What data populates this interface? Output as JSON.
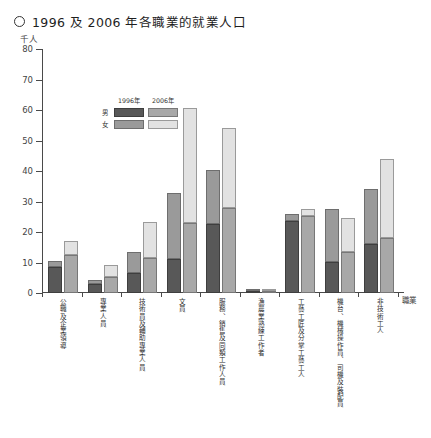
{
  "header": {
    "bullet_icon": "circle-outline-icon",
    "title": "1996 及 2006 年各職業的就業人口"
  },
  "legend": {
    "col_headers": [
      "1996年",
      "2006年"
    ],
    "row_labels": [
      "男",
      "女"
    ],
    "position": "top-left-inside-plot"
  },
  "axes": {
    "y_unit": "千人",
    "x_name": "職業",
    "y_ticks": [
      "0",
      "10",
      "20",
      "30",
      "40",
      "50",
      "60",
      "70",
      "80"
    ]
  },
  "chart_data": {
    "type": "bar",
    "subtype": "grouped-stacked",
    "title": "1996 及 2006 年各職業的就業人口",
    "xlabel": "職業",
    "ylabel": "千人",
    "ylim": [
      0,
      80
    ],
    "ytick_step": 10,
    "grid": false,
    "legend_position": "inside top-left",
    "categories": [
      "公職及企業領導",
      "專業人員",
      "技術員及輔助專業人員",
      "文員",
      "服務、銷售及同類工作人員",
      "漁農業熟練工作者",
      "工藝工匠及分掌工藝工人",
      "機台、機械操作員、司機及裝配員",
      "非技術工人"
    ],
    "series": [
      {
        "name": "1996年 男",
        "year": "1996",
        "sex": "男",
        "color": "#585858",
        "values": [
          8.5,
          3.0,
          6.7,
          11.2,
          22.7,
          0.7,
          23.5,
          10.2,
          16.0
        ]
      },
      {
        "name": "1996年 女",
        "year": "1996",
        "sex": "女",
        "color": "#9a9a9a",
        "values": [
          2.0,
          1.2,
          6.7,
          21.6,
          17.7,
          0.1,
          2.3,
          17.5,
          18.1
        ]
      },
      {
        "name": "2006年 男",
        "year": "2006",
        "sex": "男",
        "color": "#a8a8a8",
        "values": [
          12.4,
          5.1,
          11.5,
          23.0,
          27.8,
          0.6,
          25.2,
          13.3,
          18.0
        ]
      },
      {
        "name": "2006年 女",
        "year": "2006",
        "sex": "女",
        "color": "#e2e2e2",
        "values": [
          4.6,
          4.1,
          11.8,
          37.5,
          26.4,
          0.1,
          2.2,
          11.3,
          26.1
        ]
      }
    ],
    "totals": {
      "1996": [
        10.5,
        4.2,
        13.4,
        32.8,
        40.4,
        0.8,
        25.8,
        27.7,
        34.1
      ],
      "2006": [
        17.0,
        9.2,
        23.3,
        60.5,
        54.2,
        0.7,
        27.4,
        24.6,
        44.1
      ]
    }
  },
  "colors": {
    "male_1996": "#585858",
    "female_1996": "#9a9a9a",
    "male_2006": "#a8a8a8",
    "female_2006": "#e2e2e2",
    "axis": "#4a4a4a",
    "background": "#ffffff"
  }
}
